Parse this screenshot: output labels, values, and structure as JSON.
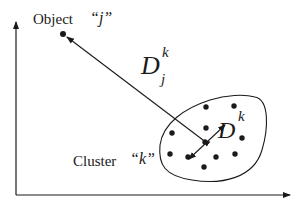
{
  "diagram": {
    "object_label": "Object",
    "object_name": "“j”",
    "cluster_label": "Cluster",
    "cluster_name": "“k”",
    "distance_to_object": {
      "base": "D",
      "superscript": "k",
      "subscript": "j"
    },
    "cluster_spread": {
      "base": "D",
      "superscript": "k"
    },
    "colors": {
      "ink": "#1a1a1a",
      "background": "#ffffff"
    },
    "axes": {
      "x_axis": "horizontal arrow",
      "y_axis": "vertical arrow"
    },
    "object_point": {
      "x": 63,
      "y": 34
    },
    "cluster_center": {
      "x": 205,
      "y": 142
    },
    "cluster_points": [
      {
        "x": 205,
        "y": 142
      },
      {
        "x": 206,
        "y": 128
      },
      {
        "x": 206,
        "y": 107
      },
      {
        "x": 234,
        "y": 106
      },
      {
        "x": 171,
        "y": 133
      },
      {
        "x": 241,
        "y": 138
      },
      {
        "x": 170,
        "y": 154
      },
      {
        "x": 188,
        "y": 157
      },
      {
        "x": 216,
        "y": 157
      },
      {
        "x": 235,
        "y": 154
      },
      {
        "x": 204,
        "y": 167
      },
      {
        "x": 226,
        "y": 171
      }
    ]
  }
}
